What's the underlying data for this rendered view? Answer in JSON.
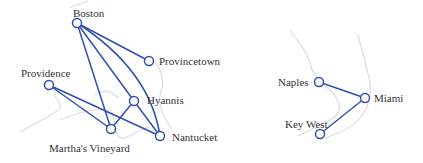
{
  "colors": {
    "edge": "#2f4fb5",
    "node_fill": "#ffffff",
    "map": "#d9dde0",
    "label": "#333333"
  },
  "graphs": [
    {
      "name": "new-england",
      "nodes": [
        {
          "id": "boston",
          "label": "Boston",
          "x": 77,
          "y": 23
        },
        {
          "id": "provincetown",
          "label": "Provincetown",
          "x": 149,
          "y": 61
        },
        {
          "id": "providence",
          "label": "Providence",
          "x": 49,
          "y": 85
        },
        {
          "id": "hyannis",
          "label": "Hyannis",
          "x": 134,
          "y": 101
        },
        {
          "id": "marthas-vineyard",
          "label": "Martha's Vineyard",
          "x": 111,
          "y": 129
        },
        {
          "id": "nantucket",
          "label": "Nantucket",
          "x": 160,
          "y": 136
        }
      ],
      "edges": [
        [
          "Boston",
          "Provincetown"
        ],
        [
          "Boston",
          "Hyannis"
        ],
        [
          "Boston",
          "Nantucket"
        ],
        [
          "Boston",
          "Martha's Vineyard"
        ],
        [
          "Providence",
          "Martha's Vineyard"
        ],
        [
          "Providence",
          "Nantucket"
        ],
        [
          "Martha's Vineyard",
          "Hyannis"
        ],
        [
          "Hyannis",
          "Nantucket"
        ]
      ]
    },
    {
      "name": "florida",
      "nodes": [
        {
          "id": "naples",
          "label": "Naples",
          "x": 319,
          "y": 82
        },
        {
          "id": "miami",
          "label": "Miami",
          "x": 365,
          "y": 98
        },
        {
          "id": "key-west",
          "label": "Key West",
          "x": 320,
          "y": 134
        }
      ],
      "edges": [
        [
          "Naples",
          "Miami"
        ],
        [
          "Miami",
          "Key West"
        ]
      ]
    }
  ]
}
